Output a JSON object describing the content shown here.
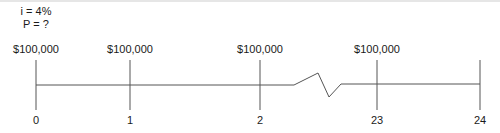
{
  "diagram": {
    "type": "cash-flow-timeline",
    "parameters": {
      "interest": "i = 4%",
      "present_value": "P = ?"
    },
    "flows": [
      {
        "period": "0",
        "amount": "$100,000",
        "x": 36
      },
      {
        "period": "1",
        "amount": "$100,000",
        "x": 130
      },
      {
        "period": "2",
        "amount": "$100,000",
        "x": 260
      },
      {
        "period": "23",
        "amount": "$100,000",
        "x": 377
      },
      {
        "period": "24",
        "amount": "",
        "x": 480
      }
    ],
    "break_symbol": "axis-break-zigzag",
    "line_color": "#555555"
  }
}
